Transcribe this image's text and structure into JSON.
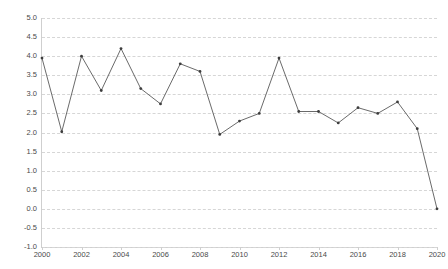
{
  "chart_data": {
    "type": "line",
    "title": "",
    "subtitle": "",
    "xlabel": "",
    "ylabel": "",
    "x": [
      2000,
      2001,
      2002,
      2003,
      2004,
      2005,
      2006,
      2007,
      2008,
      2009,
      2010,
      2011,
      2012,
      2013,
      2014,
      2015,
      2016,
      2017,
      2018,
      2019,
      2020
    ],
    "values": [
      3.95,
      2.02,
      4.0,
      3.1,
      4.2,
      3.15,
      2.75,
      3.8,
      3.6,
      1.95,
      2.3,
      2.5,
      3.95,
      2.55,
      2.55,
      2.25,
      2.65,
      2.5,
      2.8,
      2.1,
      0.0
    ],
    "series": [
      {
        "name": "",
        "values": [
          3.95,
          2.02,
          4.0,
          3.1,
          4.2,
          3.15,
          2.75,
          3.8,
          3.6,
          1.95,
          2.3,
          2.5,
          3.95,
          2.55,
          2.55,
          2.25,
          2.65,
          2.5,
          2.8,
          2.1,
          0.0
        ]
      }
    ],
    "xlim": [
      2000,
      2020
    ],
    "ylim": [
      -1.0,
      5.0
    ],
    "ytick_labels": [
      "5.0",
      "4.5",
      "4.0",
      "3.5",
      "3.0",
      "2.5",
      "2.0",
      "1.5",
      "1.0",
      "0.5",
      "0.0",
      "-0.5",
      "-1.0"
    ],
    "ytick_values": [
      5.0,
      4.5,
      4.0,
      3.5,
      3.0,
      2.5,
      2.0,
      1.5,
      1.0,
      0.5,
      0.0,
      -0.5,
      -1.0
    ],
    "xtick_labels": [
      "2000",
      "2002",
      "2004",
      "2006",
      "2008",
      "2010",
      "2012",
      "2014",
      "2016",
      "2018",
      "2020"
    ],
    "xtick_values": [
      2000,
      2002,
      2004,
      2006,
      2008,
      2010,
      2012,
      2014,
      2016,
      2018,
      2020
    ],
    "grid": true,
    "grid_style": "dashed",
    "legend": false,
    "legend_position": "none",
    "markers": true,
    "colors": {
      "line": "#595959",
      "marker": "#3d3d3d",
      "grid": "#d6d6d6",
      "axis": "#cfcfcf",
      "tick_text": "#4a4a4a",
      "background": "#ffffff"
    }
  }
}
